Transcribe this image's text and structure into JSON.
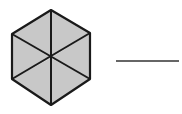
{
  "diagram": {
    "type": "fraction-shading",
    "shape": "hexagon",
    "total_parts": 6,
    "shaded_parts": 6,
    "fill_color": "#c8c8c8",
    "stroke_color": "#1a1a1a",
    "background": "#ffffff",
    "answer_line": {
      "text": ""
    }
  }
}
